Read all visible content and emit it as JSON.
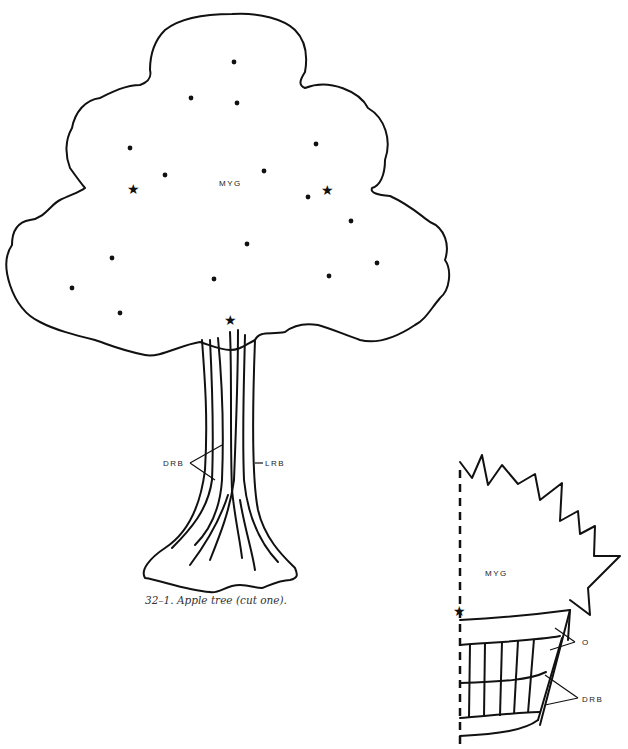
{
  "figure": {
    "tree": {
      "crown_label": "MYG",
      "bark_dark_label": "DRB",
      "bark_light_label": "LRB",
      "caption": "32–1.  Apple tree (cut one).",
      "markers": {
        "dots": 19,
        "stars": 3
      }
    },
    "basket_piece": {
      "top_label": "MYG",
      "rim_label": "O",
      "slats_label": "DRB",
      "fold_line": "dashed",
      "markers": {
        "stars": 1
      },
      "caption_clipped": true
    }
  },
  "colors": {
    "line": "#111111",
    "background": "#ffffff"
  }
}
